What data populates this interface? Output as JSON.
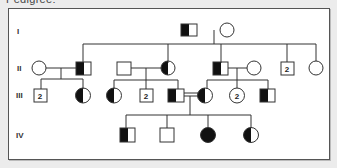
{
  "title": "Pedigree:",
  "generations": [
    "I",
    "II",
    "III",
    "IV"
  ],
  "legend_symbols": {
    "square": "male",
    "circle": "female",
    "half_filled": "carrier",
    "filled": "affected",
    "number_inside": "count of unaffected siblings"
  },
  "individuals": {
    "I": [
      {
        "id": "I-1",
        "sex": "male",
        "status": "carrier"
      },
      {
        "id": "I-2",
        "sex": "female",
        "status": "unaffected"
      }
    ],
    "II": [
      {
        "id": "II-spouse-1",
        "sex": "female",
        "status": "unaffected"
      },
      {
        "id": "II-1",
        "sex": "male",
        "status": "carrier"
      },
      {
        "id": "II-spouse-2",
        "sex": "male",
        "status": "unaffected"
      },
      {
        "id": "II-2",
        "sex": "female",
        "status": "carrier"
      },
      {
        "id": "II-3",
        "sex": "male",
        "status": "carrier"
      },
      {
        "id": "II-spouse-3",
        "sex": "female",
        "status": "unaffected"
      },
      {
        "id": "II-4",
        "sex": "male",
        "status": "unaffected",
        "count": "2"
      },
      {
        "id": "II-5",
        "sex": "female",
        "status": "unaffected"
      }
    ],
    "III": [
      {
        "id": "III-1",
        "sex": "male",
        "status": "unaffected",
        "count": "2"
      },
      {
        "id": "III-2",
        "sex": "female",
        "status": "carrier"
      },
      {
        "id": "III-3",
        "sex": "female",
        "status": "carrier"
      },
      {
        "id": "III-4",
        "sex": "male",
        "status": "unaffected",
        "count": "2"
      },
      {
        "id": "III-5",
        "sex": "male",
        "status": "carrier"
      },
      {
        "id": "III-6",
        "sex": "female",
        "status": "carrier"
      },
      {
        "id": "III-7",
        "sex": "female",
        "status": "unaffected",
        "count": "2"
      },
      {
        "id": "III-8",
        "sex": "male",
        "status": "carrier"
      }
    ],
    "IV": [
      {
        "id": "IV-1",
        "sex": "male",
        "status": "carrier"
      },
      {
        "id": "IV-2",
        "sex": "male",
        "status": "unaffected"
      },
      {
        "id": "IV-3",
        "sex": "female",
        "status": "affected"
      },
      {
        "id": "IV-4",
        "sex": "female",
        "status": "carrier"
      }
    ]
  },
  "consanguineous_marriage": "III-5 = III-6",
  "counts": {
    "two": "2"
  }
}
